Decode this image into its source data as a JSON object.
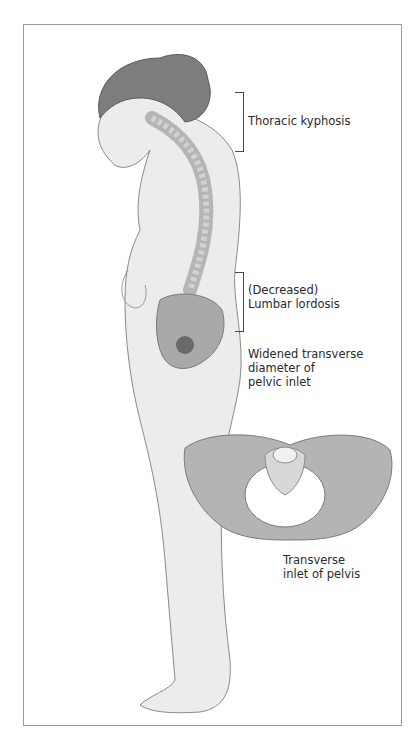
{
  "figure": {
    "colors": {
      "skin": "#ececec",
      "skin_outline": "#8a8a8a",
      "hair": "#7d7d7d",
      "bone": "#a9a9a9",
      "bone_light": "#d2d2d2",
      "frame": "#9a9a9a"
    }
  },
  "labels": {
    "thoracic": "Thoracic kyphosis",
    "lumbar": "(Decreased)\nLumbar lordosis",
    "pelvic_inlet": "Widened transverse\ndiameter of\npelvic inlet",
    "transverse_inlet": "Transverse\ninlet of pelvis"
  }
}
